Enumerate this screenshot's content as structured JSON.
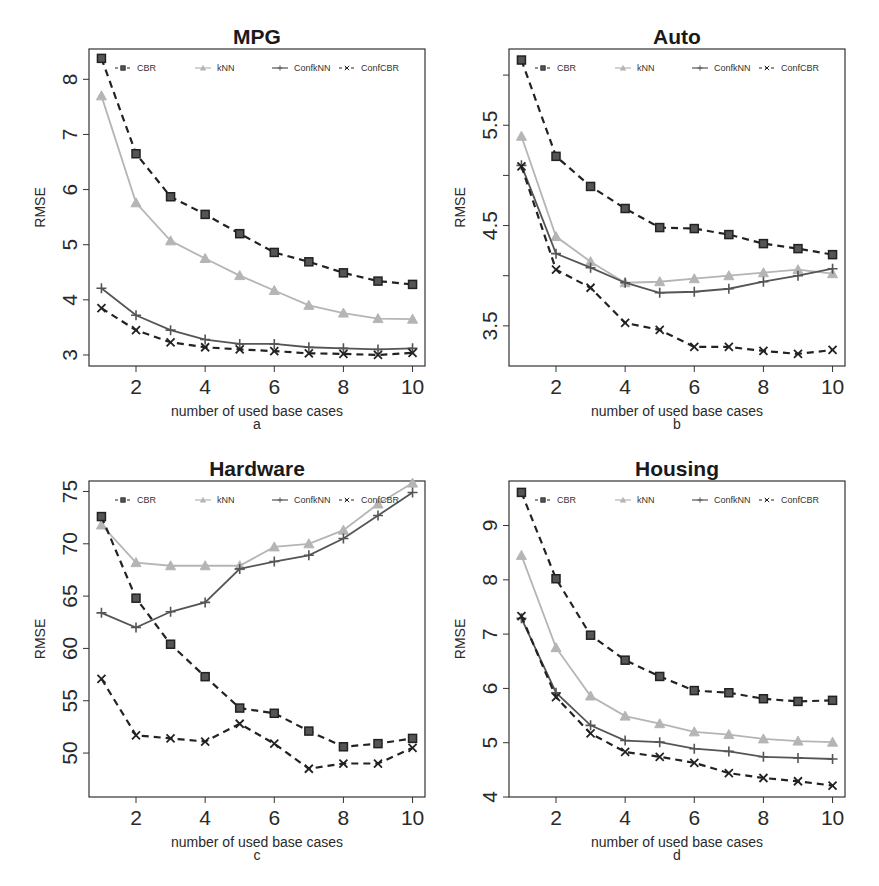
{
  "chart_data": [
    {
      "type": "line",
      "panel_label": "a",
      "title": "MPG",
      "xlabel": "number of used base cases",
      "ylabel": "RMSE",
      "x": [
        1,
        2,
        3,
        4,
        5,
        6,
        7,
        8,
        9,
        10
      ],
      "xticks": [
        2,
        4,
        6,
        8,
        10
      ],
      "yticks": [
        3,
        4,
        5,
        6,
        7,
        8
      ],
      "ylim": [
        2.8,
        8.55
      ],
      "xlim": [
        0.64,
        10.36
      ],
      "legend_position": "top-inside",
      "series": [
        {
          "name": "CBR",
          "style": "dashed",
          "marker": "square",
          "color": "#222222",
          "values": [
            8.38,
            6.65,
            5.87,
            5.55,
            5.2,
            4.86,
            4.69,
            4.49,
            4.34,
            4.28
          ]
        },
        {
          "name": "kNN",
          "style": "solid",
          "marker": "triangle",
          "color": "#b5b5b5",
          "values": [
            7.7,
            5.76,
            5.07,
            4.75,
            4.44,
            4.17,
            3.9,
            3.76,
            3.66,
            3.65
          ]
        },
        {
          "name": "ConfkNN",
          "style": "solid",
          "marker": "plus",
          "color": "#555555",
          "values": [
            4.21,
            3.72,
            3.45,
            3.28,
            3.2,
            3.2,
            3.14,
            3.12,
            3.1,
            3.12
          ]
        },
        {
          "name": "ConfCBR",
          "style": "dashed",
          "marker": "cross",
          "color": "#222222",
          "values": [
            3.85,
            3.45,
            3.23,
            3.14,
            3.1,
            3.07,
            3.03,
            3.02,
            3.0,
            3.04
          ]
        }
      ]
    },
    {
      "type": "line",
      "panel_label": "b",
      "title": "Auto",
      "xlabel": "number of used base cases",
      "ylabel": "RMSE",
      "x": [
        1,
        2,
        3,
        4,
        5,
        6,
        7,
        8,
        9,
        10
      ],
      "xticks": [
        2,
        4,
        6,
        8,
        10
      ],
      "yticks": [
        3.5,
        4.5,
        5.5
      ],
      "ytick_minor": [
        4.0,
        5.0,
        6.0
      ],
      "ylim": [
        3.1,
        6.26
      ],
      "xlim": [
        0.64,
        10.36
      ],
      "legend_position": "top-inside",
      "series": [
        {
          "name": "CBR",
          "style": "dashed",
          "marker": "square",
          "color": "#222222",
          "values": [
            6.15,
            5.19,
            4.89,
            4.67,
            4.48,
            4.47,
            4.41,
            4.32,
            4.27,
            4.21
          ]
        },
        {
          "name": "kNN",
          "style": "solid",
          "marker": "triangle",
          "color": "#b5b5b5",
          "values": [
            5.39,
            4.39,
            4.14,
            3.93,
            3.94,
            3.97,
            4.0,
            4.03,
            4.06,
            4.02
          ]
        },
        {
          "name": "ConfkNN",
          "style": "solid",
          "marker": "plus",
          "color": "#555555",
          "values": [
            5.1,
            4.22,
            4.08,
            3.93,
            3.83,
            3.84,
            3.87,
            3.94,
            4.0,
            4.07
          ]
        },
        {
          "name": "ConfCBR",
          "style": "dashed",
          "marker": "cross",
          "color": "#222222",
          "values": [
            5.09,
            4.06,
            3.88,
            3.53,
            3.46,
            3.29,
            3.29,
            3.25,
            3.22,
            3.26
          ]
        }
      ]
    },
    {
      "type": "line",
      "panel_label": "c",
      "title": "Hardware",
      "xlabel": "number of used base cases",
      "ylabel": "RMSE",
      "x": [
        1,
        2,
        3,
        4,
        5,
        6,
        7,
        8,
        9,
        10
      ],
      "xticks": [
        2,
        4,
        6,
        8,
        10
      ],
      "yticks": [
        50,
        55,
        60,
        65,
        70,
        75
      ],
      "ylim": [
        45.8,
        76.0
      ],
      "xlim": [
        0.64,
        10.36
      ],
      "legend_position": "top-inside",
      "series": [
        {
          "name": "CBR",
          "style": "dashed",
          "marker": "square",
          "color": "#222222",
          "values": [
            72.6,
            64.8,
            60.4,
            57.3,
            54.3,
            53.8,
            52.1,
            50.6,
            50.9,
            51.4
          ]
        },
        {
          "name": "kNN",
          "style": "solid",
          "marker": "triangle",
          "color": "#b5b5b5",
          "values": [
            71.8,
            68.2,
            67.9,
            67.9,
            67.9,
            69.7,
            70.0,
            71.3,
            73.8,
            75.8
          ]
        },
        {
          "name": "ConfkNN",
          "style": "solid",
          "marker": "plus",
          "color": "#555555",
          "values": [
            63.4,
            62.0,
            63.5,
            64.4,
            67.6,
            68.3,
            68.9,
            70.5,
            72.7,
            74.9
          ]
        },
        {
          "name": "ConfCBR",
          "style": "dashed",
          "marker": "cross",
          "color": "#222222",
          "values": [
            57.1,
            51.7,
            51.4,
            51.1,
            52.8,
            50.9,
            48.5,
            49.0,
            49.0,
            50.5
          ]
        }
      ]
    },
    {
      "type": "line",
      "panel_label": "d",
      "title": "Housing",
      "xlabel": "number of used base cases",
      "ylabel": "RMSE",
      "x": [
        1,
        2,
        3,
        4,
        5,
        6,
        7,
        8,
        9,
        10
      ],
      "xticks": [
        2,
        4,
        6,
        8,
        10
      ],
      "yticks": [
        4,
        5,
        6,
        7,
        8,
        9
      ],
      "ylim": [
        4.0,
        9.82
      ],
      "xlim": [
        0.64,
        10.36
      ],
      "legend_position": "top-inside",
      "series": [
        {
          "name": "CBR",
          "style": "dashed",
          "marker": "square",
          "color": "#222222",
          "values": [
            9.61,
            8.02,
            6.98,
            6.52,
            6.22,
            5.96,
            5.92,
            5.81,
            5.76,
            5.78
          ]
        },
        {
          "name": "kNN",
          "style": "solid",
          "marker": "triangle",
          "color": "#b5b5b5",
          "values": [
            8.45,
            6.75,
            5.86,
            5.49,
            5.35,
            5.2,
            5.15,
            5.07,
            5.03,
            5.01
          ]
        },
        {
          "name": "ConfkNN",
          "style": "solid",
          "marker": "plus",
          "color": "#555555",
          "values": [
            7.29,
            5.92,
            5.32,
            5.04,
            5.01,
            4.89,
            4.84,
            4.74,
            4.72,
            4.7
          ]
        },
        {
          "name": "ConfCBR",
          "style": "dashed",
          "marker": "cross",
          "color": "#222222",
          "values": [
            7.33,
            5.84,
            5.17,
            4.83,
            4.74,
            4.63,
            4.44,
            4.35,
            4.29,
            4.21
          ]
        }
      ]
    }
  ],
  "panels": [
    {
      "title": "MPG",
      "label": "a"
    },
    {
      "title": "Auto",
      "label": "b"
    },
    {
      "title": "Hardware",
      "label": "c"
    },
    {
      "title": "Housing",
      "label": "d"
    }
  ]
}
